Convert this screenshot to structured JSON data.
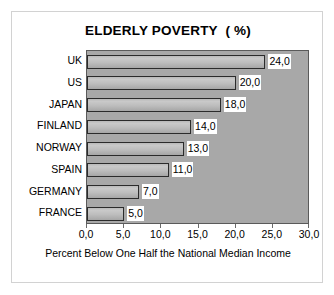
{
  "chart_data": {
    "type": "bar",
    "orientation": "horizontal",
    "title": "ELDERLY POVERTY  ( %)",
    "xlabel": "Percent Below One Half the National Median Income",
    "ylabel": "",
    "categories": [
      "UK",
      "US",
      "JAPAN",
      "FINLAND",
      "NORWAY",
      "SPAIN",
      "GERMANY",
      "FRANCE"
    ],
    "values": [
      24.0,
      20.0,
      18.0,
      14.0,
      13.0,
      11.0,
      7.0,
      5.0
    ],
    "data_labels": [
      "24,0",
      "20,0",
      "18,0",
      "14,0",
      "13,0",
      "11,0",
      "7,0",
      "5,0"
    ],
    "xlim": [
      0,
      30
    ],
    "xticks": [
      0,
      5,
      10,
      15,
      20,
      25,
      30
    ],
    "xtick_labels": [
      "0,0",
      "5,0",
      "10,0",
      "15,0",
      "20,0",
      "25,0",
      "30,0"
    ],
    "grid": false,
    "legend": false,
    "colors": {
      "plot_background": "#a8a8a8",
      "bar_fill": "#c0c0c0",
      "bar_border": "#2b2b2b",
      "axis": "#5a5a5a",
      "text": "#000000",
      "frame_border": "#d2d2d2",
      "label_background": "#ffffff"
    }
  }
}
